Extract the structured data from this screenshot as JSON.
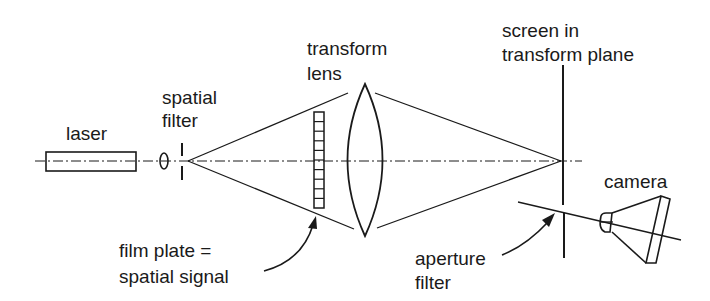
{
  "diagram": {
    "colors": {
      "line": "#1a1a1a",
      "background": "#ffffff"
    },
    "labels": {
      "laser": "laser",
      "spatial_filter": [
        "spatial",
        "filter"
      ],
      "transform_lens": [
        "transform",
        "lens"
      ],
      "screen": [
        "screen  in",
        "transform  plane"
      ],
      "camera": "camera",
      "film_plate": [
        "film  plate =",
        "spatial  signal"
      ],
      "aperture_filter": [
        "aperture",
        "filter"
      ]
    },
    "components": [
      {
        "id": "laser",
        "shape": "rectangle"
      },
      {
        "id": "spatial-filter",
        "shape": "pinhole lens + slit"
      },
      {
        "id": "film-plate",
        "shape": "segmented strip",
        "segments": 10
      },
      {
        "id": "transform-lens",
        "shape": "biconvex lens"
      },
      {
        "id": "screen",
        "shape": "vertical line with aperture gap"
      },
      {
        "id": "camera",
        "shape": "truncated cone"
      }
    ]
  }
}
